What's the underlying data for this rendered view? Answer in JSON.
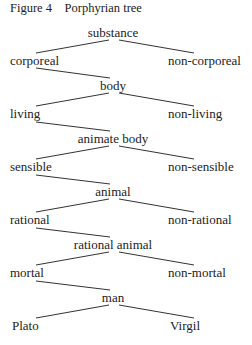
{
  "figure": {
    "label": "Figure 4",
    "title": "Porphyrian tree"
  },
  "tree": {
    "levels": [
      {
        "genus": "substance",
        "left": "corporeal",
        "right": "non-corporeal"
      },
      {
        "genus": "body",
        "left": "living",
        "right": "non-living"
      },
      {
        "genus": "animate body",
        "left": "sensible",
        "right": "non-sensible"
      },
      {
        "genus": "animal",
        "left": "rational",
        "right": "non-rational"
      },
      {
        "genus": "rational animal",
        "left": "mortal",
        "right": "non-mortal"
      },
      {
        "genus": "man",
        "left": "Plato",
        "right": "Virgil"
      }
    ]
  },
  "colors": {
    "text": "#222222",
    "line": "#333333",
    "background": "#ffffff"
  }
}
